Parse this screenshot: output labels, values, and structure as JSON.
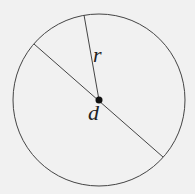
{
  "diagram": {
    "type": "circle",
    "labels": {
      "radius": "r",
      "diameter": "d"
    },
    "colors": {
      "background": "#f1f1f1",
      "stroke": "#333333",
      "center_dot": "#111111"
    }
  }
}
